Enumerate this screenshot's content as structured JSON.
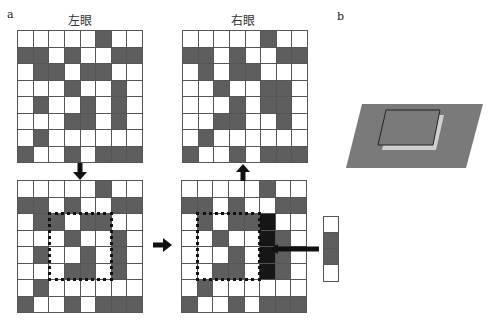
{
  "panel_a": {
    "label": "a",
    "left_eye_title": "左眼",
    "right_eye_title": "右眼",
    "cell_colors": {
      "white": "#ffffff",
      "dark": "#5e5e5e",
      "black": "#161616"
    },
    "top_left_grid": [
      "WWWWWDWW",
      "DDWDWWDD",
      "WDDWDDWW",
      "WWWDWWDW",
      "WDWWDWDW",
      "WWWDDWDW",
      "WDWWWWWW",
      "DWWDWDDD"
    ],
    "top_right_grid": [
      "WWWWWDWW",
      "DDWDWWDD",
      "WDWDDWWW",
      "WWDWWDDW",
      "WWWDWDDW",
      "WWDDWWDW",
      "WDWWWWWW",
      "DWWDWDDD"
    ],
    "bottom_left_grid": [
      "WWWWWDWW",
      "DDWDWWDD",
      "WDDWDDWW",
      "WWWDWWDW",
      "WDWWDWDW",
      "WWWDDWDW",
      "WDWWWWWW",
      "DWWDWDDD"
    ],
    "bottom_right_grid": [
      "WWWWWDWW",
      "DDWDWWDD",
      "WDWDDBWW",
      "WWDWWBDW",
      "WWWDWBDW",
      "WWDDWBDW",
      "WDWWWWWW",
      "DWWDWDDD"
    ],
    "bottom_left_dotted_region": {
      "col_start": 2,
      "col_end": 5,
      "row_start": 2,
      "row_end": 5
    },
    "bottom_right_dotted_region": {
      "col_start": 1,
      "col_end": 4,
      "row_start": 2,
      "row_end": 5
    },
    "side_strip": [
      "W",
      "D",
      "D",
      "W"
    ]
  },
  "panel_b": {
    "label": "b",
    "plane_color": "#7a7a7a",
    "shadow_color": "#cfcfcf",
    "outline_color": "#222222"
  }
}
